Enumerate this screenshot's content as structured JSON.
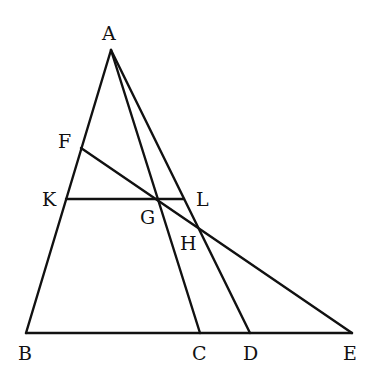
{
  "diagram": {
    "type": "geometry",
    "points": {
      "A": {
        "label": "A",
        "x": 111,
        "y": 50
      },
      "B": {
        "label": "B",
        "x": 26,
        "y": 333
      },
      "C": {
        "label": "C",
        "x": 200,
        "y": 333
      },
      "D": {
        "label": "D",
        "x": 250,
        "y": 333
      },
      "E": {
        "label": "E",
        "x": 352,
        "y": 333
      },
      "F": {
        "label": "F",
        "x": 81,
        "y": 148
      },
      "K": {
        "label": "K",
        "x": 66,
        "y": 199
      },
      "L": {
        "label": "L",
        "x": 184,
        "y": 199
      },
      "G": {
        "label": "G",
        "x": 156,
        "y": 199
      },
      "H": {
        "label": "H",
        "x": 200,
        "y": 230
      }
    },
    "segments": [
      [
        "A",
        "B"
      ],
      [
        "A",
        "C"
      ],
      [
        "A",
        "D"
      ],
      [
        "B",
        "E"
      ],
      [
        "F",
        "E"
      ],
      [
        "K",
        "L"
      ]
    ],
    "line_color": "#111111"
  }
}
